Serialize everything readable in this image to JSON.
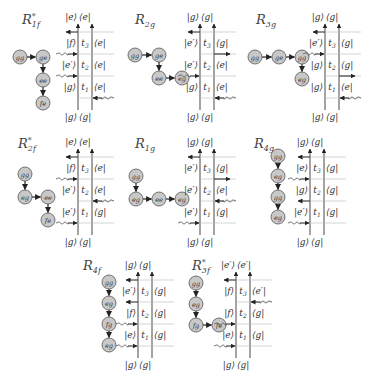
{
  "figure": {
    "background": "#ffffff",
    "node_fill": "#c8c8c8",
    "node_stroke": "#555555",
    "line_color": "#444444",
    "panels": [
      {
        "id": "R1f",
        "title": {
          "base": "R",
          "sub": "1f",
          "sup": "*"
        },
        "title_pos": [
          22,
          12
        ],
        "graph": {
          "nodes": [
            {
              "label": "gg",
              "x": 20,
              "y": 57
            },
            {
              "label": "ge",
              "x": 43,
              "y": 57
            },
            {
              "label": "ee",
              "x": 43,
              "y": 80
            },
            {
              "label": "fe",
              "x": 43,
              "y": 103
            }
          ],
          "edges": [
            [
              0,
              1
            ],
            [
              1,
              2
            ],
            [
              2,
              3
            ]
          ]
        },
        "ladder": {
          "x": 78,
          "y": 10,
          "top_left": "|e⟩",
          "top_right": "⟨e|",
          "bottom_left": "|g⟩",
          "bottom_right": "⟨g|",
          "rows": [
            {
              "left": "|f⟩",
              "mid": "t3",
              "right": "⟨e|"
            },
            {
              "left": "|e′⟩",
              "mid": "t2",
              "right": "⟨e|"
            },
            {
              "left": "|g⟩",
              "mid": "t1",
              "right": "⟨e|"
            }
          ],
          "arrows": [
            {
              "side": "left",
              "dir": "out",
              "level": 0
            },
            {
              "side": "left",
              "dir": "in",
              "level": 1
            },
            {
              "side": "left",
              "dir": "in",
              "level": 2
            },
            {
              "side": "right",
              "dir": "in",
              "level": 3
            }
          ]
        }
      },
      {
        "id": "R2g",
        "title": {
          "base": "R",
          "sub": "2g",
          "sup": ""
        },
        "title_pos": [
          135,
          12
        ],
        "graph": {
          "nodes": [
            {
              "label": "gg",
              "x": 135,
              "y": 55
            },
            {
              "label": "ge",
              "x": 159,
              "y": 55
            },
            {
              "label": "ee",
              "x": 159,
              "y": 78
            },
            {
              "label": "eg",
              "x": 182,
              "y": 78
            }
          ],
          "edges": [
            [
              0,
              1
            ],
            [
              1,
              2
            ],
            [
              2,
              3
            ]
          ]
        },
        "ladder": {
          "x": 200,
          "y": 10,
          "top_left": "|g⟩",
          "top_right": "⟨g|",
          "bottom_left": "|g⟩",
          "bottom_right": "⟨g|",
          "rows": [
            {
              "left": "|e′⟩",
              "mid": "t3",
              "right": "⟨g|"
            },
            {
              "left": "|e′⟩",
              "mid": "t2",
              "right": "⟨e|"
            },
            {
              "left": "|g⟩",
              "mid": "t1",
              "right": "⟨e|"
            }
          ],
          "arrows": [
            {
              "side": "left",
              "dir": "out",
              "level": 0
            },
            {
              "side": "right",
              "dir": "out",
              "level": 1
            },
            {
              "side": "left",
              "dir": "in",
              "level": 2
            },
            {
              "side": "right",
              "dir": "in",
              "level": 3
            }
          ]
        }
      },
      {
        "id": "R3g",
        "title": {
          "base": "R",
          "sub": "3g",
          "sup": ""
        },
        "title_pos": [
          256,
          12
        ],
        "graph": {
          "nodes": [
            {
              "label": "gg",
              "x": 255,
              "y": 57
            },
            {
              "label": "ge",
              "x": 279,
              "y": 57
            },
            {
              "label": "gg",
              "x": 302,
              "y": 57
            },
            {
              "label": "eg",
              "x": 302,
              "y": 79
            }
          ],
          "edges": [
            [
              0,
              1
            ],
            [
              1,
              2
            ],
            [
              2,
              3
            ]
          ]
        },
        "ladder": {
          "x": 325,
          "y": 10,
          "top_left": "|g⟩",
          "top_right": "⟨g|",
          "bottom_left": "|g⟩",
          "bottom_right": "⟨g|",
          "rows": [
            {
              "left": "|e′⟩",
              "mid": "t3",
              "right": "⟨g|"
            },
            {
              "left": "|g⟩",
              "mid": "t2",
              "right": "⟨g|"
            },
            {
              "left": "|g⟩",
              "mid": "t1",
              "right": "⟨e|"
            }
          ],
          "arrows": [
            {
              "side": "left",
              "dir": "out",
              "level": 0
            },
            {
              "side": "left",
              "dir": "in",
              "level": 1
            },
            {
              "side": "right",
              "dir": "out",
              "level": 2
            },
            {
              "side": "right",
              "dir": "in",
              "level": 3
            }
          ]
        }
      },
      {
        "id": "R2f",
        "title": {
          "base": "R",
          "sub": "2f",
          "sup": "*"
        },
        "title_pos": [
          18,
          136
        ],
        "graph": {
          "nodes": [
            {
              "label": "gg",
              "x": 25,
              "y": 174
            },
            {
              "label": "eg",
              "x": 25,
              "y": 197
            },
            {
              "label": "ee",
              "x": 48,
              "y": 197
            },
            {
              "label": "fe",
              "x": 48,
              "y": 220
            }
          ],
          "edges": [
            [
              0,
              1
            ],
            [
              1,
              2
            ],
            [
              2,
              3
            ]
          ]
        },
        "ladder": {
          "x": 78,
          "y": 135,
          "top_left": "|e⟩",
          "top_right": "⟨e|",
          "bottom_left": "|g⟩",
          "bottom_right": "⟨g|",
          "rows": [
            {
              "left": "|f⟩",
              "mid": "t3",
              "right": "⟨e|"
            },
            {
              "left": "|e′⟩",
              "mid": "t2",
              "right": "⟨e|"
            },
            {
              "left": "|e′⟩",
              "mid": "t1",
              "right": "⟨g|"
            }
          ],
          "arrows": [
            {
              "side": "left",
              "dir": "out",
              "level": 0
            },
            {
              "side": "left",
              "dir": "in",
              "level": 1
            },
            {
              "side": "right",
              "dir": "in",
              "level": 2
            },
            {
              "side": "left",
              "dir": "in",
              "level": 3
            }
          ]
        }
      },
      {
        "id": "R1g",
        "title": {
          "base": "R",
          "sub": "1g",
          "sup": ""
        },
        "title_pos": [
          135,
          136
        ],
        "graph": {
          "nodes": [
            {
              "label": "gg",
              "x": 136,
              "y": 176
            },
            {
              "label": "eg",
              "x": 136,
              "y": 199
            },
            {
              "label": "ee",
              "x": 159,
              "y": 199
            },
            {
              "label": "eg",
              "x": 182,
              "y": 199
            }
          ],
          "edges": [
            [
              0,
              1
            ],
            [
              1,
              2
            ],
            [
              2,
              3
            ]
          ]
        },
        "ladder": {
          "x": 200,
          "y": 135,
          "top_left": "|g⟩",
          "top_right": "⟨g|",
          "bottom_left": "|g⟩",
          "bottom_right": "⟨g|",
          "rows": [
            {
              "left": "|e′⟩",
              "mid": "t3",
              "right": "⟨g|"
            },
            {
              "left": "|e′⟩",
              "mid": "t2",
              "right": "⟨e|"
            },
            {
              "left": "|e′⟩",
              "mid": "t1",
              "right": "⟨g|"
            }
          ],
          "arrows": [
            {
              "side": "left",
              "dir": "out",
              "level": 0
            },
            {
              "side": "right",
              "dir": "out",
              "level": 1
            },
            {
              "side": "right",
              "dir": "in",
              "level": 2
            },
            {
              "side": "left",
              "dir": "in",
              "level": 3
            }
          ]
        }
      },
      {
        "id": "R4g",
        "title": {
          "base": "R",
          "sub": "4g",
          "sup": ""
        },
        "title_pos": [
          254,
          136
        ],
        "graph": {
          "nodes": [
            {
              "label": "gg",
              "x": 278,
              "y": 156
            },
            {
              "label": "eg",
              "x": 278,
              "y": 176
            },
            {
              "label": "gg",
              "x": 278,
              "y": 197
            },
            {
              "label": "eg",
              "x": 278,
              "y": 217
            }
          ],
          "edges": [
            [
              0,
              1
            ],
            [
              1,
              2
            ],
            [
              2,
              3
            ]
          ]
        },
        "ladder": {
          "x": 310,
          "y": 135,
          "top_left": "|g⟩",
          "top_right": "⟨g|",
          "bottom_left": "|g⟩",
          "bottom_right": "⟨g|",
          "rows": [
            {
              "left": "|e⟩",
              "mid": "t3",
              "right": "⟨g|"
            },
            {
              "left": "|g⟩",
              "mid": "t2",
              "right": "⟨g|"
            },
            {
              "left": "|e′⟩",
              "mid": "t1",
              "right": "⟨g|"
            }
          ],
          "arrows": [
            {
              "side": "left",
              "dir": "out",
              "level": 0
            },
            {
              "side": "left",
              "dir": "in",
              "level": 1
            },
            {
              "side": "left",
              "dir": "out",
              "level": 2
            },
            {
              "side": "left",
              "dir": "in",
              "level": 3
            }
          ]
        }
      },
      {
        "id": "R4f",
        "title": {
          "base": "R",
          "sub": "4f",
          "sup": ""
        },
        "title_pos": [
          83,
          258
        ],
        "graph": {
          "nodes": [
            {
              "label": "gg",
              "x": 109,
              "y": 282
            },
            {
              "label": "eg",
              "x": 109,
              "y": 303
            },
            {
              "label": "fg",
              "x": 109,
              "y": 324
            },
            {
              "label": "eg",
              "x": 109,
              "y": 345
            }
          ],
          "edges": [
            [
              0,
              1
            ],
            [
              1,
              2
            ],
            [
              2,
              3
            ]
          ]
        },
        "ladder": {
          "x": 138,
          "y": 258,
          "top_left": "|g⟩",
          "top_right": "⟨g|",
          "bottom_left": "|g⟩",
          "bottom_right": "⟨g|",
          "rows": [
            {
              "left": "|e′⟩",
              "mid": "t3",
              "right": "⟨g|"
            },
            {
              "left": "|f⟩",
              "mid": "t2",
              "right": "⟨g|"
            },
            {
              "left": "|e⟩",
              "mid": "t1",
              "right": "⟨g|"
            }
          ],
          "arrows": [
            {
              "side": "left",
              "dir": "out",
              "level": 0
            },
            {
              "side": "left",
              "dir": "out",
              "level": 1
            },
            {
              "side": "left",
              "dir": "in",
              "level": 2
            },
            {
              "side": "left",
              "dir": "in",
              "level": 3
            }
          ]
        }
      },
      {
        "id": "R3f",
        "title": {
          "base": "R",
          "sub": "3f",
          "sup": "*"
        },
        "title_pos": [
          192,
          258
        ],
        "graph": {
          "nodes": [
            {
              "label": "gg",
              "x": 196,
              "y": 283
            },
            {
              "label": "eg",
              "x": 196,
              "y": 304
            },
            {
              "label": "fg",
              "x": 196,
              "y": 325
            },
            {
              "label": "fe",
              "x": 219,
              "y": 325
            }
          ],
          "edges": [
            [
              0,
              1
            ],
            [
              1,
              2
            ],
            [
              2,
              3
            ]
          ]
        },
        "ladder": {
          "x": 236,
          "y": 258,
          "top_left": "|e′⟩",
          "top_right": "⟨e′|",
          "bottom_left": "|g⟩",
          "bottom_right": "⟨g|",
          "rows": [
            {
              "left": "|f⟩",
              "mid": "t3",
              "right": "⟨e′|"
            },
            {
              "left": "|f⟩",
              "mid": "t2",
              "right": "⟨g|"
            },
            {
              "left": "|e⟩",
              "mid": "t1",
              "right": "⟨g|"
            }
          ],
          "arrows": [
            {
              "side": "left",
              "dir": "out",
              "level": 0
            },
            {
              "side": "right",
              "dir": "in",
              "level": 1
            },
            {
              "side": "left",
              "dir": "in",
              "level": 2
            },
            {
              "side": "left",
              "dir": "in",
              "level": 3
            }
          ]
        }
      }
    ]
  }
}
